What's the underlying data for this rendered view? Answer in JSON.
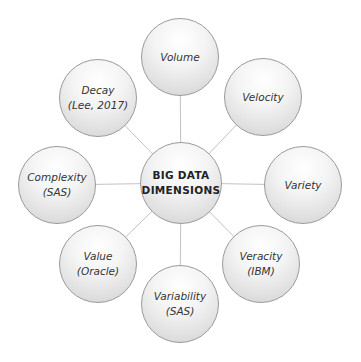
{
  "diagram": {
    "center": {
      "line1": "BIG DATA",
      "line2": "DIMENSIONS"
    },
    "nodes": [
      {
        "id": "volume",
        "line1": "Volume"
      },
      {
        "id": "velocity",
        "line1": "Velocity"
      },
      {
        "id": "variety",
        "line1": "Variety"
      },
      {
        "id": "veracity",
        "line1": "Veracity",
        "line2": "(IBM)"
      },
      {
        "id": "variability",
        "line1": "Variability",
        "line2": "(SAS)"
      },
      {
        "id": "value",
        "line1": "Value",
        "line2": "(Oracle)"
      },
      {
        "id": "complexity",
        "line1": "Complexity",
        "line2": "(SAS)"
      },
      {
        "id": "decay",
        "line1": "Decay",
        "line2": "(Lee, 2017)"
      }
    ],
    "colors": {
      "line": "#c2c2c2",
      "circle_border": "#9a9a9a",
      "circle_fill_light": "#ffffff",
      "circle_fill_dark": "#cfcfcf",
      "label_text": "#333333",
      "hub_text": "#222222",
      "background": "#ffffff"
    }
  }
}
